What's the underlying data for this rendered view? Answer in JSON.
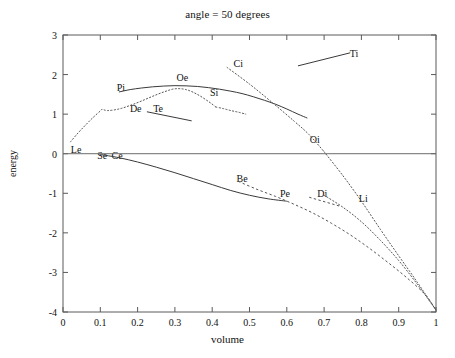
{
  "chart_data": {
    "type": "line",
    "title": "angle = 50 degrees",
    "xlabel": "volume",
    "ylabel": "energy",
    "xlim": [
      0,
      1
    ],
    "ylim": [
      -4,
      3
    ],
    "grid": false,
    "legend": "none (inline curve labels)",
    "xticks": [
      "0",
      "0.1",
      "0.2",
      "0.3",
      "0.4",
      "0.5",
      "0.6",
      "0.7",
      "0.8",
      "0.9",
      "1"
    ],
    "xtick_values": [
      0,
      0.1,
      0.2,
      0.3,
      0.4,
      0.5,
      0.6,
      0.7,
      0.8,
      0.9,
      1
    ],
    "yticks": [
      "3",
      "2",
      "1",
      "0",
      "-1",
      "-2",
      "-3",
      "-4"
    ],
    "ytick_values": [
      3,
      2,
      1,
      0,
      -1,
      -2,
      -3,
      -4
    ],
    "zero_line": 0,
    "annotations": [
      {
        "text": "Ti",
        "x": 0.78,
        "y": 2.55
      },
      {
        "text": "Ci",
        "x": 0.47,
        "y": 2.28
      },
      {
        "text": "Oe",
        "x": 0.32,
        "y": 1.93
      },
      {
        "text": "Pi",
        "x": 0.155,
        "y": 1.68
      },
      {
        "text": "Si",
        "x": 0.405,
        "y": 1.56
      },
      {
        "text": "De",
        "x": 0.195,
        "y": 1.16
      },
      {
        "text": "Te",
        "x": 0.255,
        "y": 1.16
      },
      {
        "text": "Oi",
        "x": 0.675,
        "y": 0.38
      },
      {
        "text": "Le",
        "x": 0.035,
        "y": 0.11
      },
      {
        "text": "Se",
        "x": 0.105,
        "y": -0.03
      },
      {
        "text": "Ce",
        "x": 0.145,
        "y": -0.03
      },
      {
        "text": "Be",
        "x": 0.48,
        "y": -0.62
      },
      {
        "text": "Pe",
        "x": 0.595,
        "y": -1.0
      },
      {
        "text": "Di",
        "x": 0.695,
        "y": -1.0
      },
      {
        "text": "Li",
        "x": 0.805,
        "y": -1.12
      }
    ],
    "series": [
      {
        "name": "Pi-Oe-Si upper solid hump",
        "style": "solid",
        "x": [
          0.15,
          0.18,
          0.21,
          0.24,
          0.27,
          0.3,
          0.33,
          0.36,
          0.39,
          0.42,
          0.45,
          0.48,
          0.51,
          0.54,
          0.57,
          0.6,
          0.63,
          0.655
        ],
        "y": [
          1.56,
          1.62,
          1.66,
          1.69,
          1.71,
          1.72,
          1.715,
          1.7,
          1.67,
          1.63,
          1.58,
          1.52,
          1.44,
          1.35,
          1.25,
          1.13,
          1.0,
          0.9
        ]
      },
      {
        "name": "Le rising dotted curve",
        "style": "dotted",
        "x": [
          0.02,
          0.04,
          0.06,
          0.08,
          0.1,
          0.105,
          0.12,
          0.15,
          0.18,
          0.21,
          0.24,
          0.27,
          0.3,
          0.33,
          0.36,
          0.39,
          0.41
        ],
        "y": [
          0.3,
          0.52,
          0.72,
          0.91,
          1.08,
          1.12,
          1.09,
          1.13,
          1.22,
          1.33,
          1.45,
          1.56,
          1.64,
          1.62,
          1.5,
          1.32,
          1.18
        ]
      },
      {
        "name": "Si descending dotted tail",
        "style": "dotted",
        "x": [
          0.41,
          0.43,
          0.45,
          0.47,
          0.49
        ],
        "y": [
          1.18,
          1.14,
          1.09,
          1.05,
          1.0
        ]
      },
      {
        "name": "Ci dotted diagonal to Oi",
        "style": "dotted",
        "x": [
          0.44,
          0.5,
          0.56,
          0.62,
          0.66,
          0.7
        ],
        "y": [
          2.18,
          1.76,
          1.3,
          0.82,
          0.48,
          0.05
        ]
      },
      {
        "name": "Ti short solid segment",
        "style": "solid-segment",
        "x": [
          0.63,
          0.77
        ],
        "y": [
          2.22,
          2.55
        ]
      },
      {
        "name": "Te short solid segment",
        "style": "solid-segment",
        "x": [
          0.225,
          0.345
        ],
        "y": [
          1.06,
          0.83
        ]
      },
      {
        "name": "Se-Ce-Be-Pe lower solid curve",
        "style": "solid",
        "x": [
          0.1,
          0.15,
          0.2,
          0.25,
          0.3,
          0.35,
          0.4,
          0.45,
          0.5,
          0.55,
          0.6
        ],
        "y": [
          -0.02,
          -0.1,
          -0.21,
          -0.34,
          -0.48,
          -0.63,
          -0.78,
          -0.93,
          -1.05,
          -1.14,
          -1.2
        ]
      },
      {
        "name": "Oi descending dotted to (1,-4)",
        "style": "dotted",
        "x": [
          0.7,
          0.75,
          0.8,
          0.85,
          0.9,
          0.95,
          1.0
        ],
        "y": [
          0.05,
          -0.55,
          -1.2,
          -1.9,
          -2.58,
          -3.25,
          -3.95
        ]
      },
      {
        "name": "Be-Pe-Di dashed lower branch",
        "style": "dashed",
        "x": [
          0.47,
          0.52,
          0.57,
          0.62,
          0.67,
          0.72,
          0.77,
          0.82,
          0.87,
          0.92,
          0.97,
          1.0
        ],
        "y": [
          -0.7,
          -0.9,
          -1.08,
          -1.28,
          -1.5,
          -1.76,
          -2.05,
          -2.38,
          -2.74,
          -3.12,
          -3.55,
          -3.95
        ]
      },
      {
        "name": "Li dotted branch",
        "style": "dotted",
        "x": [
          0.7,
          0.75,
          0.8,
          0.85,
          0.9,
          0.95,
          1.0
        ],
        "y": [
          -1.05,
          -1.35,
          -1.72,
          -2.18,
          -2.7,
          -3.3,
          -3.95
        ]
      },
      {
        "name": "Di short dashed segment",
        "style": "dashed",
        "x": [
          0.66,
          0.74
        ],
        "y": [
          -1.1,
          -1.32
        ]
      }
    ]
  },
  "figure": {
    "title": "angle = 50 degrees",
    "xlabel": "volume",
    "ylabel": "energy"
  }
}
